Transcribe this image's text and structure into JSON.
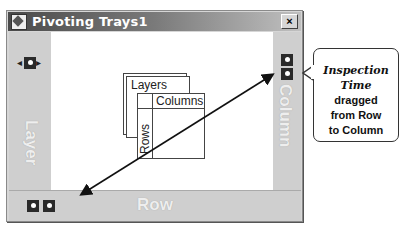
{
  "window": {
    "title": "Pivoting Trays1",
    "close_label": "×"
  },
  "trays": {
    "layer": "Layer",
    "column": "Column",
    "row": "Row"
  },
  "diagram": {
    "layers": "Layers",
    "columns": "Columns",
    "rows": "Rows"
  },
  "callout": {
    "line1": "Inspection",
    "line2": "Time",
    "line3": "dragged",
    "line4": "from Row",
    "line5": "to Column"
  },
  "icons": {
    "layer_tray": "pivot-icon-with-arrows",
    "column_tray": [
      "pivot-icon",
      "pivot-icon"
    ],
    "row_tray": [
      "pivot-icon",
      "pivot-icon"
    ]
  }
}
